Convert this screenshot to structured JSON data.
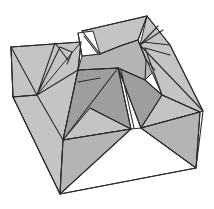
{
  "diagram": {
    "title": "",
    "colors": {
      "background": "#ffffff",
      "light_face": "#c4c4c4",
      "mid_face": "#b4b4b4",
      "dark_face": "#9e9e9e",
      "white_face": "#ffffff",
      "stroke": "#2a2a2a"
    },
    "faces": [
      {
        "name": "front-left-outer-wall",
        "tone": "white_face",
        "points": "11,47 13,97 60,194"
      },
      {
        "name": "front-bottom-white",
        "tone": "white_face",
        "points": "60,194 196,168 141,128 131,129 63,140"
      },
      {
        "name": "left-back-flap",
        "tone": "light_face",
        "points": "11,47 81,42 78,70 37,95 13,97"
      },
      {
        "name": "left-rim-panel",
        "tone": "light_face",
        "points": "37,95 81,42 78,70 63,140 60,194 13,97"
      },
      {
        "name": "left-inner-dark-wall",
        "tone": "dark_face",
        "points": "78,70 118,68 131,129 63,140"
      },
      {
        "name": "left-front-triangle-upper",
        "tone": "light_face",
        "points": "63,140 90,108 131,129"
      },
      {
        "name": "left-front-triangle-lower",
        "tone": "mid_face",
        "points": "63,140 131,129 60,194"
      },
      {
        "name": "back-top-panel",
        "tone": "light_face",
        "points": "82,31 147,16 138,40 120,46 102,55"
      },
      {
        "name": "back-inner-dark-wall",
        "tone": "mid_face",
        "points": "78,70 82,56 100,54 120,46 138,40 146,60 155,70 145,80 118,68"
      },
      {
        "name": "right-inner-dark-wall",
        "tone": "dark_face",
        "points": "118,68 145,80 162,95 200,112 141,128"
      },
      {
        "name": "right-rim-panel",
        "tone": "light_face",
        "points": "147,16 170,45 203,111 200,112 162,95 140,45"
      },
      {
        "name": "right-front-triangle-upper",
        "tone": "light_face",
        "points": "141,128 162,95 200,112"
      },
      {
        "name": "right-front-triangle-lower",
        "tone": "mid_face",
        "points": "141,128 200,112 196,168"
      },
      {
        "name": "back-white-notch",
        "tone": "white_face",
        "points": "78,33 93,31 100,54 82,56"
      }
    ],
    "lines": [
      {
        "name": "outer-left-edge",
        "d": "M11,47 L13,97 L60,194"
      },
      {
        "name": "outer-bottom-edge",
        "d": "M60,194 L196,168"
      },
      {
        "name": "outer-right-edge",
        "d": "M196,168 L203,111 L170,45 L147,16"
      },
      {
        "name": "back-top-edge",
        "d": "M11,47 L81,42 M82,31 L147,16"
      },
      {
        "name": "left-flap-creases",
        "d": "M11,47 L37,95 M37,95 L55,43 M37,95 L60,47 M55,43 L68,60 M60,47 L72,52 L67,64 M37,95 L78,70 M13,97 L37,95"
      },
      {
        "name": "left-corner-edges",
        "d": "M37,95 L63,140 M81,42 L78,70 L63,140 L60,194"
      },
      {
        "name": "left-inner-wall-edges",
        "d": "M78,70 L118,68 M78,82 L100,78 M63,140 L118,68"
      },
      {
        "name": "center-valley",
        "d": "M118,68 L131,129 M121,70 L134,128 M118,68 L141,128"
      },
      {
        "name": "left-front-triangle-edges",
        "d": "M63,140 L131,129 L60,194 M90,108 L131,129"
      },
      {
        "name": "right-front-triangle-edges",
        "d": "M141,128 L200,112 L196,168 M141,128 L162,95 L200,112 M141,128 L196,168"
      },
      {
        "name": "back-notch-edges",
        "d": "M78,33 L82,56 M82,31 L100,54 L120,46 L138,40 M84,36 L98,54"
      },
      {
        "name": "right-back-creases",
        "d": "M138,40 L147,16 M140,45 L158,26 M140,45 L163,30 M143,42 L170,45 M145,48 L170,55 M146,60 L155,70 M138,40 L146,60 M140,45 L203,111"
      },
      {
        "name": "right-inner-wall-edges",
        "d": "M118,68 L145,80 L162,95 M145,80 L146,60 M162,95 L145,48"
      }
    ]
  }
}
